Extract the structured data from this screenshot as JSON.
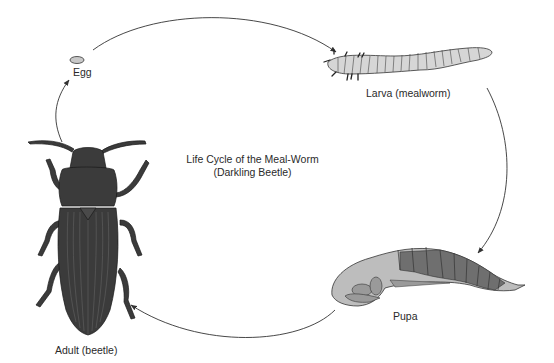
{
  "diagram": {
    "title_line1": "Life Cycle of the Meal-Worm",
    "title_line2": "(Darkling Beetle)",
    "stages": [
      {
        "id": "egg",
        "label": "Egg"
      },
      {
        "id": "larva",
        "label": "Larva (mealworm)"
      },
      {
        "id": "pupa",
        "label": "Pupa"
      },
      {
        "id": "adult",
        "label": "Adult (beetle)"
      }
    ],
    "arrows": [
      {
        "from": "egg",
        "to": "larva"
      },
      {
        "from": "larva",
        "to": "pupa"
      },
      {
        "from": "pupa",
        "to": "adult"
      },
      {
        "from": "adult",
        "to": "egg"
      }
    ],
    "colors": {
      "background": "#ffffff",
      "beetle": "#3a3a3a",
      "larva": "#d4d4d4",
      "pupa_light": "#bdbdbd",
      "pupa_dark": "#6e6e6e",
      "arrow": "#333333"
    }
  }
}
